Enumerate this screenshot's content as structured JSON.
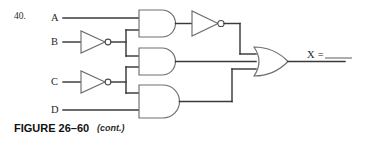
{
  "figure": {
    "problem_number": "40.",
    "caption_main": "FIGURE 26–60",
    "caption_cont": "(cont.)",
    "type": "logic-circuit-diagram"
  },
  "inputs": [
    {
      "id": "A",
      "label": "A",
      "inverted": false
    },
    {
      "id": "B",
      "label": "B",
      "inverted": true
    },
    {
      "id": "C",
      "label": "C",
      "inverted": true
    },
    {
      "id": "D",
      "label": "D",
      "inverted": false
    }
  ],
  "output": {
    "label": "X =",
    "value": "",
    "blank": true
  },
  "gates": [
    {
      "id": "and-top",
      "type": "AND",
      "inputs": [
        "A",
        "B-not"
      ],
      "feeds": "not-top"
    },
    {
      "id": "not-top",
      "type": "NOT",
      "inputs": [
        "and-top"
      ],
      "feeds": "or-out"
    },
    {
      "id": "and-mid",
      "type": "AND",
      "inputs": [
        "B-not",
        "C-not"
      ],
      "feeds": "or-out"
    },
    {
      "id": "and-bot",
      "type": "AND",
      "inputs": [
        "C-not",
        "D"
      ],
      "feeds": "or-out"
    },
    {
      "id": "not-b",
      "type": "NOT",
      "inputs": [
        "B"
      ],
      "feeds": "and-top"
    },
    {
      "id": "not-c",
      "type": "NOT",
      "inputs": [
        "C"
      ],
      "feeds": "and-mid"
    },
    {
      "id": "or-out",
      "type": "OR",
      "inputs": [
        "not-top",
        "and-mid",
        "and-bot"
      ],
      "feeds": "X"
    }
  ],
  "colors": {
    "wire": "#3a3a3a",
    "gate_outline": "#6e6e6e",
    "text": "#1f1f1f",
    "background": "#ffffff"
  }
}
